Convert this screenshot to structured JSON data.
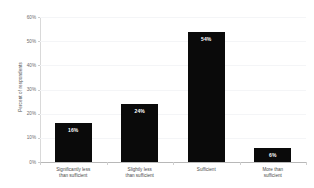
{
  "chart_data": {
    "type": "bar",
    "title": "",
    "xlabel": "",
    "ylabel": "Percent of respondents",
    "categories": [
      "Significantly less\nthan sufficient",
      "Slightly less\nthan sufficient",
      "Sufficient",
      "More than\nsufficient"
    ],
    "values": [
      16,
      24,
      54,
      6
    ],
    "value_labels": [
      "16%",
      "24%",
      "54%",
      "6%"
    ],
    "ylim": [
      0,
      60
    ],
    "ytick_values": [
      0,
      10,
      20,
      30,
      40,
      50,
      60
    ],
    "ytick_labels": [
      "0%",
      "10%",
      "20%",
      "30%",
      "40%",
      "50%",
      "60%"
    ],
    "grid": true,
    "legend": false,
    "bar_color": "#0a0a0a",
    "value_label_color": "#ffffff",
    "gridline_color": "#f4f5f7",
    "axis_color": "#b8b8b8",
    "background": "#ffffff"
  }
}
